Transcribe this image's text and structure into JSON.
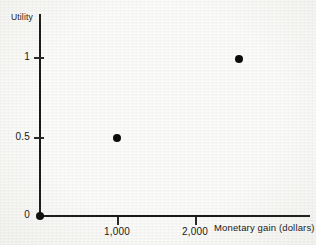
{
  "chart_data": {
    "type": "scatter",
    "title": "",
    "xlabel": "Monetary gain (dollars)",
    "ylabel": "Utility",
    "xlim": [
      0,
      3460
    ],
    "ylim": [
      0,
      1.3
    ],
    "grid": false,
    "legend": "none",
    "x_ticks": [
      {
        "value": 1000,
        "label": "1,000"
      },
      {
        "value": 2000,
        "label": "2,000"
      }
    ],
    "y_ticks": [
      {
        "value": 0,
        "label": "0"
      },
      {
        "value": 0.5,
        "label": "0.5"
      },
      {
        "value": 1,
        "label": "1"
      }
    ],
    "points": [
      {
        "x": 0,
        "y": 0,
        "px": 40,
        "py": 216
      },
      {
        "x": 1000,
        "y": 0.5,
        "px": 117,
        "py": 138
      },
      {
        "x": 2560,
        "y": 1,
        "px": 239,
        "py": 59
      }
    ],
    "marker": "filled-circle",
    "marker_color": "#0c0c0c",
    "axis_color": "#1a1a1a",
    "background_color": "#fdfdfb"
  },
  "axes": {
    "y_title": "Utility",
    "x_title": "Monetary gain (dollars)",
    "y_tick_labels": [
      "1",
      "0.5",
      "0"
    ],
    "x_tick_labels": [
      "1,000",
      "2,000"
    ]
  }
}
